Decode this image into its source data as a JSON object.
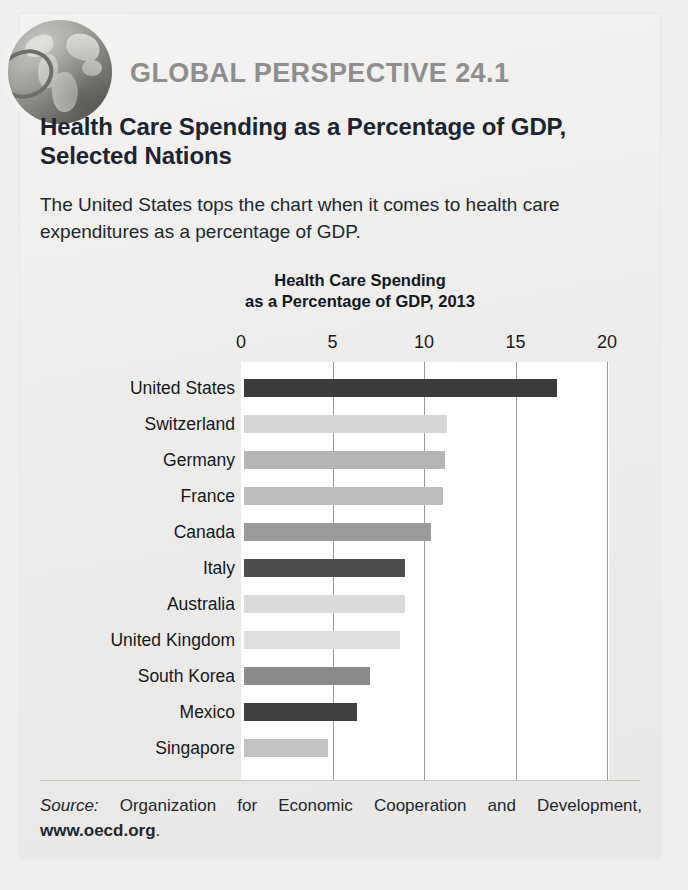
{
  "card": {
    "globe_icon": "globe-icon",
    "kicker": "GLOBAL PERSPECTIVE 24.1",
    "title": "Health Care Spending as a Percentage of GDP, Selected Nations",
    "intro": "The United States tops the chart when it comes to health care expenditures as a percentage of GDP."
  },
  "source": {
    "label": "Source:",
    "text": " Organization for Economic Cooperation and Development, ",
    "url": "www.oecd.org",
    "period": "."
  },
  "chart_data": {
    "type": "bar",
    "orientation": "horizontal",
    "title": "Health Care Spending\nas a Percentage of GDP, 2013",
    "title_line1": "Health Care Spending",
    "title_line2": "as a Percentage of GDP, 2013",
    "xlabel": "",
    "ylabel": "",
    "xlim": [
      0,
      20
    ],
    "ticks": [
      0,
      5,
      10,
      15,
      20
    ],
    "tick_labels": [
      "0",
      "5",
      "10",
      "15",
      "20"
    ],
    "grid": true,
    "legend": "none",
    "categories": [
      "United States",
      "Switzerland",
      "Germany",
      "France",
      "Canada",
      "Italy",
      "Australia",
      "United Kingdom",
      "South Korea",
      "Mexico",
      "Singapore"
    ],
    "values": [
      17.1,
      11.1,
      11.0,
      10.9,
      10.2,
      8.8,
      8.8,
      8.5,
      6.9,
      6.2,
      4.6
    ],
    "bar_colors": [
      "#3b3b3b",
      "#d6d6d6",
      "#b5b5b5",
      "#bdbdbd",
      "#9b9b9b",
      "#4d4d4d",
      "#dadada",
      "#e0e0e0",
      "#8b8b8b",
      "#414141",
      "#c3c3c3"
    ]
  },
  "colors": {
    "page_background": "#efeeec",
    "card_background": "#f2f1ef",
    "kicker_gray": "#8e8e8e",
    "title_ink": "#1b2430",
    "plot_background": "#ffffff",
    "gridline": "#9a9a9a"
  }
}
